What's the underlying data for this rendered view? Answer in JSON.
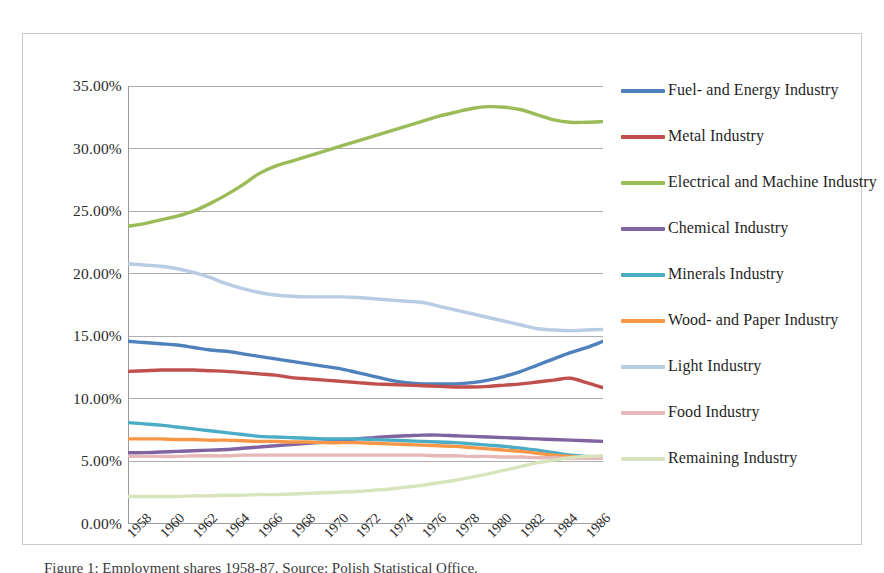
{
  "chart_data": {
    "type": "line",
    "title": "",
    "xlabel": "",
    "ylabel": "",
    "ylim": [
      0,
      35
    ],
    "ytick_labels": [
      "0.00%",
      "5.00%",
      "10.00%",
      "15.00%",
      "20.00%",
      "25.00%",
      "30.00%",
      "35.00%"
    ],
    "ytick_values": [
      0,
      5,
      10,
      15,
      20,
      25,
      30,
      35
    ],
    "grid": true,
    "legend_position": "right",
    "x": [
      1958,
      1959,
      1960,
      1961,
      1962,
      1963,
      1964,
      1965,
      1966,
      1967,
      1968,
      1969,
      1970,
      1971,
      1972,
      1973,
      1974,
      1975,
      1976,
      1977,
      1978,
      1979,
      1980,
      1981,
      1982,
      1983,
      1984,
      1985,
      1986,
      1987
    ],
    "xtick_labels": [
      "1958",
      "1960",
      "1962",
      "1964",
      "1966",
      "1968",
      "1970",
      "1972",
      "1974",
      "1976",
      "1978",
      "1980",
      "1982",
      "1984",
      "1986"
    ],
    "series": [
      {
        "name": "Fuel- and Energy Industry",
        "color": "#4F81BD",
        "values": [
          14.6,
          14.5,
          14.4,
          14.3,
          14.1,
          13.9,
          13.8,
          13.6,
          13.4,
          13.2,
          13.0,
          12.8,
          12.6,
          12.4,
          12.1,
          11.8,
          11.5,
          11.3,
          11.2,
          11.2,
          11.2,
          11.3,
          11.5,
          11.8,
          12.2,
          12.7,
          13.2,
          13.7,
          14.1,
          14.6
        ]
      },
      {
        "name": "Metal Industry",
        "color": "#C0504D",
        "values": [
          12.2,
          12.25,
          12.3,
          12.3,
          12.3,
          12.25,
          12.2,
          12.1,
          12.0,
          11.9,
          11.7,
          11.6,
          11.5,
          11.4,
          11.3,
          11.2,
          11.15,
          11.1,
          11.05,
          11.0,
          10.95,
          10.95,
          11.0,
          11.1,
          11.2,
          11.35,
          11.5,
          11.65,
          11.3,
          10.9
        ]
      },
      {
        "name": "Electrical and Machine Industry",
        "color": "#9BBB59",
        "values": [
          23.8,
          24.0,
          24.3,
          24.6,
          25.0,
          25.6,
          26.3,
          27.1,
          28.0,
          28.6,
          29.0,
          29.4,
          29.8,
          30.2,
          30.6,
          31.0,
          31.4,
          31.8,
          32.2,
          32.6,
          32.9,
          33.2,
          33.35,
          33.3,
          33.1,
          32.7,
          32.3,
          32.1,
          32.1,
          32.15
        ]
      },
      {
        "name": "Chemical Industry",
        "color": "#8064A2",
        "values": [
          5.7,
          5.7,
          5.75,
          5.8,
          5.85,
          5.9,
          5.95,
          6.05,
          6.15,
          6.25,
          6.35,
          6.45,
          6.55,
          6.65,
          6.8,
          6.9,
          7.0,
          7.05,
          7.1,
          7.1,
          7.05,
          7.0,
          6.95,
          6.9,
          6.85,
          6.8,
          6.75,
          6.7,
          6.65,
          6.6
        ]
      },
      {
        "name": "Minerals Industry",
        "color": "#4BACC6",
        "values": [
          8.1,
          8.0,
          7.9,
          7.75,
          7.6,
          7.45,
          7.3,
          7.15,
          7.0,
          6.95,
          6.9,
          6.85,
          6.8,
          6.8,
          6.8,
          6.75,
          6.7,
          6.65,
          6.6,
          6.55,
          6.5,
          6.4,
          6.3,
          6.2,
          6.05,
          5.9,
          5.7,
          5.5,
          5.4,
          5.35
        ]
      },
      {
        "name": "Wood- and Paper Industry",
        "color": "#F79646",
        "values": [
          6.8,
          6.8,
          6.8,
          6.75,
          6.75,
          6.7,
          6.7,
          6.65,
          6.6,
          6.6,
          6.55,
          6.55,
          6.5,
          6.5,
          6.5,
          6.45,
          6.4,
          6.35,
          6.3,
          6.25,
          6.2,
          6.1,
          6.0,
          5.9,
          5.8,
          5.65,
          5.5,
          5.4,
          5.35,
          5.3
        ]
      },
      {
        "name": "Light Industry",
        "color": "#B8CCE4",
        "values": [
          20.8,
          20.7,
          20.6,
          20.4,
          20.1,
          19.7,
          19.2,
          18.8,
          18.5,
          18.3,
          18.2,
          18.15,
          18.15,
          18.15,
          18.1,
          18.0,
          17.9,
          17.8,
          17.7,
          17.4,
          17.1,
          16.8,
          16.5,
          16.2,
          15.9,
          15.6,
          15.5,
          15.45,
          15.5,
          15.55
        ]
      },
      {
        "name": "Food Industry",
        "color": "#E6B9B8",
        "values": [
          5.4,
          5.4,
          5.4,
          5.4,
          5.45,
          5.45,
          5.45,
          5.5,
          5.5,
          5.5,
          5.5,
          5.5,
          5.5,
          5.5,
          5.5,
          5.5,
          5.5,
          5.5,
          5.5,
          5.45,
          5.45,
          5.4,
          5.4,
          5.35,
          5.35,
          5.3,
          5.3,
          5.25,
          5.25,
          5.25
        ]
      },
      {
        "name": "Remaining Industry",
        "color": "#D7E4BC",
        "values": [
          2.2,
          2.2,
          2.2,
          2.2,
          2.25,
          2.25,
          2.3,
          2.3,
          2.35,
          2.35,
          2.4,
          2.45,
          2.5,
          2.55,
          2.6,
          2.7,
          2.8,
          2.95,
          3.1,
          3.3,
          3.5,
          3.75,
          4.0,
          4.3,
          4.6,
          4.9,
          5.1,
          5.3,
          5.4,
          5.45
        ]
      }
    ]
  },
  "legend": {
    "items": [
      {
        "label": "Fuel- and Energy Industry",
        "color": "#4F81BD"
      },
      {
        "label": "Metal Industry",
        "color": "#C0504D"
      },
      {
        "label": "Electrical and Machine Industry",
        "color": "#9BBB59"
      },
      {
        "label": "Chemical Industry",
        "color": "#8064A2"
      },
      {
        "label": "Minerals Industry",
        "color": "#4BACC6"
      },
      {
        "label": "Wood- and Paper Industry",
        "color": "#F79646"
      },
      {
        "label": "Light Industry",
        "color": "#B8CCE4"
      },
      {
        "label": "Food Industry",
        "color": "#E6B9B8"
      },
      {
        "label": "Remaining Industry",
        "color": "#D7E4BC"
      }
    ]
  },
  "caption": {
    "text": "Figure 1: Employment shares 1958-87. Source: Polish Statistical Office."
  }
}
